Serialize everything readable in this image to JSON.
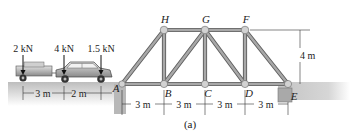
{
  "figure": {
    "caption": "(a)",
    "colors": {
      "member": "#8f8f8f",
      "member_edge": "#5e5e5e",
      "joint": "#c9c9c9",
      "ground": "#c8c8c8",
      "car": "#9a9a9a",
      "text": "#222222"
    }
  },
  "truss": {
    "joints": {
      "A": "A",
      "B": "B",
      "C": "C",
      "D": "D",
      "E": "E",
      "F": "F",
      "G": "G",
      "H": "H"
    },
    "height_label": "4 m",
    "spans": [
      "3 m",
      "3 m",
      "3 m",
      "3 m"
    ]
  },
  "loads": {
    "forces": [
      "2 kN",
      "4 kN",
      "1.5 kN"
    ],
    "spacing": [
      "3 m",
      "2 m"
    ]
  }
}
